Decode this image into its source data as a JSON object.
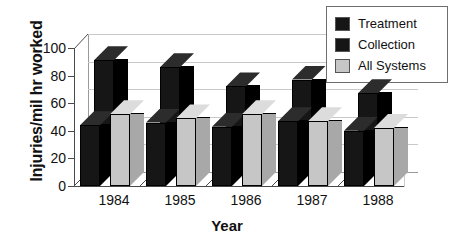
{
  "chart_data": {
    "type": "bar",
    "title": "",
    "xlabel": "Year",
    "ylabel": "Injuries/mil hr worked",
    "categories": [
      "1984",
      "1985",
      "1986",
      "1987",
      "1988"
    ],
    "series": [
      {
        "name": "Treatment",
        "color": "#161616",
        "values": [
          44,
          46,
          43,
          47,
          40
        ]
      },
      {
        "name": "Collection",
        "color": "#161616",
        "values": [
          81,
          76,
          62,
          67,
          57
        ]
      },
      {
        "name": "All Systems",
        "color": "#c6c6c6",
        "values": [
          52,
          49,
          52,
          47,
          42
        ]
      }
    ],
    "ylim": [
      0,
      100
    ],
    "yticks": [
      "0",
      "20",
      "40",
      "60",
      "80",
      "100"
    ],
    "grid": true,
    "legend_position": "top-right",
    "style": "3d-grouped-columns"
  },
  "legend": {
    "items": [
      {
        "label": "Treatment",
        "swatch": "#161616"
      },
      {
        "label": "Collection",
        "swatch": "#161616"
      },
      {
        "label": "All Systems",
        "swatch": "#c6c6c6"
      }
    ]
  }
}
